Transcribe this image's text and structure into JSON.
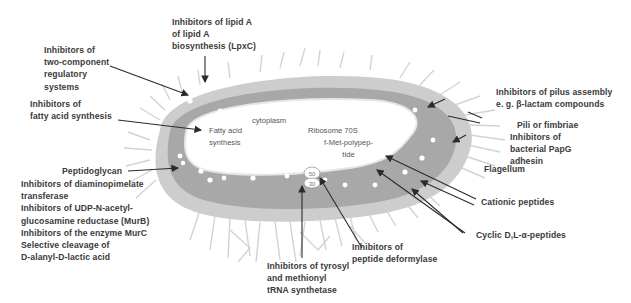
{
  "colors": {
    "background": "#ffffff",
    "outer_membrane": "#c8c8c8",
    "peptidoglycan": "#a9a9a9",
    "cytoplasm": "#ffffff",
    "appendages": "#cfcfcf",
    "label_text": "#3a3a3a",
    "arrow": "#2b2b2b"
  },
  "cell": {
    "cytoplasm_label": "cytoplasm",
    "fatty_acid_synthesis": [
      "Fatty acid",
      "synthesis"
    ],
    "ribosome_label": "Ribosome 70S",
    "ribosome_subunits": [
      "50",
      "30"
    ],
    "polypeptide_label": [
      "f-Met-polypep-",
      "tide"
    ]
  },
  "labels": {
    "lipid_a": [
      "Inhibitors of lipid A",
      "of lipid A",
      "biosynthesis (LpxC)"
    ],
    "two_component": [
      "Inhibitors of",
      "two-component",
      "regulatory",
      "systems"
    ],
    "fatty_acid": [
      "Inhibitors of",
      "fatty acid synthesis"
    ],
    "peptidoglycan": "Peptidoglycan",
    "peptidoglycan_targets": [
      "Inhibitors of diaminopimelate",
      "transferase",
      "Inhibitors of UDP-N-acetyl-",
      "glucosamine reductase (MurB)",
      "Inhibitors of the enzyme MurC",
      "Selective cleavage of",
      "D-alanyl-D-lactic acid"
    ],
    "tyrosyl": [
      "Inhibitors of tyrosyl",
      "and methionyl",
      "tRNA synthetase"
    ],
    "deformylase": [
      "Inhibitors of",
      "peptide deformylase"
    ],
    "pilus_assembly": [
      "Inhibitors of pilus assembly",
      "e. g. β-lactam compounds"
    ],
    "pili": "Pili or fimbriae",
    "papg": [
      "Inhibitors of",
      "bacterial PapG",
      "adhesin"
    ],
    "flagellum": "Flagellum",
    "cationic": "Cationic peptides",
    "cyclic": "Cyclic D,L-α-peptides"
  }
}
